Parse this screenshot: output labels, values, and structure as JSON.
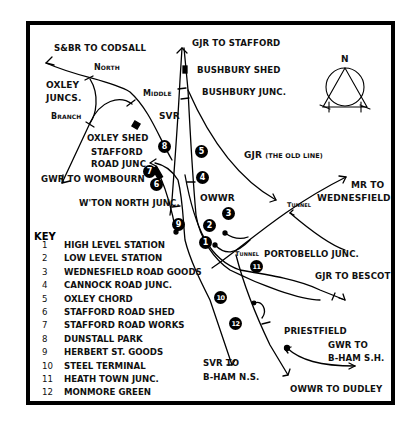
{
  "map": {
    "labels": {
      "sbr_codsall": "S&BR TO CODSALL",
      "gjr_stafford": "GJR TO STAFFORD",
      "bushbury_shed": "BUSHBURY SHED",
      "bushbury_junc": "BUSHBURY JUNC.",
      "north": "North",
      "middle": "Middle",
      "oxley_juncs_1": "OXLEY",
      "oxley_juncs_2": "JUNCS.",
      "branch": "Branch",
      "svr": "SVR",
      "oxley_shed": "OXLEY SHED",
      "stafford_road_1": "STAFFORD",
      "stafford_road_2": "ROAD JUNC",
      "gwr_wombourn": "GWR TO WOMBOURN",
      "wton_north": "W'TON NORTH JUNC.",
      "gjr_old": "GJR",
      "gjr_old_sub": "(THE OLD LINE)",
      "owwr": "OWWR",
      "mr_1": "MR TO",
      "mr_2": "WEDNESFIELD",
      "tunnel_1": "Tunnel",
      "tunnel_2": "Tunnel",
      "portobello": "PORTOBELLO JUNC.",
      "gjr_bescot": "GJR TO BESCOT",
      "priestfield": "PRIESTFIELD",
      "gwr_bham_1": "GWR TO",
      "gwr_bham_2": "B-HAM S.H.",
      "svr_bham_1": "SVR TO",
      "svr_bham_2": "B-HAM N.S.",
      "owwr_dudley": "OWWR TO DUDLEY"
    },
    "compass": {
      "label": "N"
    },
    "markers": [
      "1",
      "2",
      "3",
      "4",
      "5",
      "6",
      "7",
      "8",
      "9",
      "10",
      "11",
      "12"
    ]
  },
  "key": {
    "title": "KEY",
    "items": [
      {
        "num": "1",
        "name": "HIGH LEVEL STATION"
      },
      {
        "num": "2",
        "name": "LOW LEVEL STATION"
      },
      {
        "num": "3",
        "name": "WEDNESFIELD ROAD GOODS"
      },
      {
        "num": "4",
        "name": "CANNOCK ROAD JUNC."
      },
      {
        "num": "5",
        "name": "OXLEY CHORD"
      },
      {
        "num": "6",
        "name": "STAFFORD ROAD SHED"
      },
      {
        "num": "7",
        "name": "STAFFORD ROAD WORKS"
      },
      {
        "num": "8",
        "name": "DUNSTALL PARK"
      },
      {
        "num": "9",
        "name": "HERBERT ST. GOODS"
      },
      {
        "num": "10",
        "name": "STEEL TERMINAL"
      },
      {
        "num": "11",
        "name": "HEATH TOWN JUNC."
      },
      {
        "num": "12",
        "name": "MONMORE GREEN"
      }
    ]
  }
}
